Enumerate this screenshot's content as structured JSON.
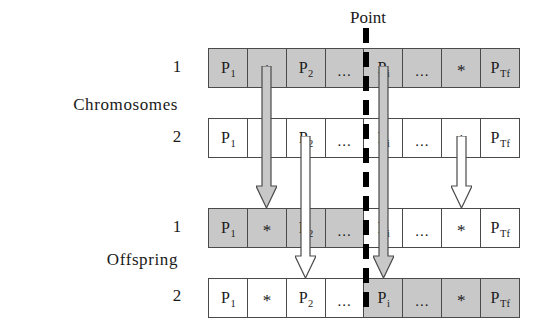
{
  "diagram": {
    "title_label": "Point",
    "groups": {
      "parents_label": "Chromosomes",
      "offspring_label": "Offspring"
    },
    "row_indices": {
      "parent_1": "1",
      "parent_2": "2",
      "offspring_1": "1",
      "offspring_2": "2"
    },
    "colors": {
      "shaded_cell": "#c8c8c8",
      "plain_cell": "#ffffff",
      "cell_border": "#4a4a4a",
      "crossover_line": "#000000",
      "arrow_fill_gray": "#c8c8c8",
      "arrow_fill_white": "#ffffff",
      "arrow_stroke": "#4a4a4a",
      "text": "#1a1a1a"
    },
    "gene_labels": {
      "p1_base": "P",
      "p1_sub": "1",
      "star": "*",
      "p2_base": "P",
      "p2_sub": "2",
      "ellipsis": "...",
      "pi_base": "P",
      "pi_sub": "i",
      "ptf_base": "P",
      "ptf_sub": "Tf"
    },
    "rows": [
      {
        "name": "parent-chromosome-1",
        "index_label": "1",
        "cells": [
          {
            "text": "P",
            "sub": "1",
            "kind": "gene",
            "shaded": true
          },
          {
            "text": "*",
            "sub": "",
            "kind": "star",
            "shaded": true
          },
          {
            "text": "P",
            "sub": "2",
            "kind": "gene",
            "shaded": true
          },
          {
            "text": "...",
            "sub": "",
            "kind": "ellipsis",
            "shaded": true
          },
          {
            "text": "P",
            "sub": "i",
            "kind": "gene",
            "shaded": true
          },
          {
            "text": "...",
            "sub": "",
            "kind": "ellipsis",
            "shaded": true
          },
          {
            "text": "*",
            "sub": "",
            "kind": "star",
            "shaded": true
          },
          {
            "text": "P",
            "sub": "Tf",
            "kind": "gene",
            "shaded": true
          }
        ]
      },
      {
        "name": "parent-chromosome-2",
        "index_label": "2",
        "cells": [
          {
            "text": "P",
            "sub": "1",
            "kind": "gene",
            "shaded": false
          },
          {
            "text": "*",
            "sub": "",
            "kind": "star",
            "shaded": false
          },
          {
            "text": "P",
            "sub": "2",
            "kind": "gene",
            "shaded": false
          },
          {
            "text": "...",
            "sub": "",
            "kind": "ellipsis",
            "shaded": false
          },
          {
            "text": "P",
            "sub": "i",
            "kind": "gene",
            "shaded": false
          },
          {
            "text": "...",
            "sub": "",
            "kind": "ellipsis",
            "shaded": false
          },
          {
            "text": "*",
            "sub": "",
            "kind": "star",
            "shaded": false
          },
          {
            "text": "P",
            "sub": "Tf",
            "kind": "gene",
            "shaded": false
          }
        ]
      },
      {
        "name": "offspring-chromosome-1",
        "index_label": "1",
        "cells": [
          {
            "text": "P",
            "sub": "1",
            "kind": "gene",
            "shaded": true
          },
          {
            "text": "*",
            "sub": "",
            "kind": "star",
            "shaded": true
          },
          {
            "text": "P",
            "sub": "2",
            "kind": "gene",
            "shaded": true
          },
          {
            "text": "...",
            "sub": "",
            "kind": "ellipsis",
            "shaded": true
          },
          {
            "text": "P",
            "sub": "i",
            "kind": "gene",
            "shaded": false
          },
          {
            "text": "...",
            "sub": "",
            "kind": "ellipsis",
            "shaded": false
          },
          {
            "text": "*",
            "sub": "",
            "kind": "star",
            "shaded": false
          },
          {
            "text": "P",
            "sub": "Tf",
            "kind": "gene",
            "shaded": false
          }
        ]
      },
      {
        "name": "offspring-chromosome-2",
        "index_label": "2",
        "cells": [
          {
            "text": "P",
            "sub": "1",
            "kind": "gene",
            "shaded": false
          },
          {
            "text": "*",
            "sub": "",
            "kind": "star",
            "shaded": false
          },
          {
            "text": "P",
            "sub": "2",
            "kind": "gene",
            "shaded": false
          },
          {
            "text": "...",
            "sub": "",
            "kind": "ellipsis",
            "shaded": false
          },
          {
            "text": "P",
            "sub": "i",
            "kind": "gene",
            "shaded": true
          },
          {
            "text": "...",
            "sub": "",
            "kind": "ellipsis",
            "shaded": true
          },
          {
            "text": "*",
            "sub": "",
            "kind": "star",
            "shaded": true
          },
          {
            "text": "P",
            "sub": "Tf",
            "kind": "gene",
            "shaded": true
          }
        ]
      }
    ],
    "arrows": [
      {
        "name": "arrow-parent1-star-to-offspring1-star",
        "fill": "gray",
        "from_row": "parent-chromosome-1",
        "to_row": "offspring-chromosome-1",
        "cell_index": 1
      },
      {
        "name": "arrow-parent1-pi-to-offspring2-pi",
        "fill": "gray",
        "from_row": "parent-chromosome-1",
        "to_row": "offspring-chromosome-2",
        "cell_index": 4
      },
      {
        "name": "arrow-parent2-p2-to-offspring2-p2",
        "fill": "white",
        "from_row": "parent-chromosome-2",
        "to_row": "offspring-chromosome-2",
        "cell_index": 2
      },
      {
        "name": "arrow-parent2-star-to-offspring1-star",
        "fill": "white",
        "from_row": "parent-chromosome-2",
        "to_row": "offspring-chromosome-1",
        "cell_index": 6
      }
    ]
  }
}
